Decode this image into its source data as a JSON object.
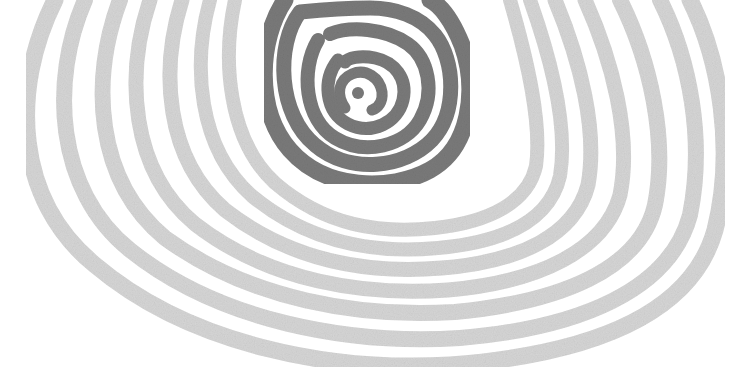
{
  "image": {
    "description": "Hand-drawn concentric ring illustration: dark gray spiral-like rings at the top center, surrounded by wide light gray rings fanning outward and downward, cropped at the top edge.",
    "colors": {
      "background": "#ffffff",
      "inner_rings": "#7a7a7a",
      "outer_rings": "#d6d6d6"
    },
    "inner_ring_count": 5,
    "outer_ring_count": 8
  }
}
